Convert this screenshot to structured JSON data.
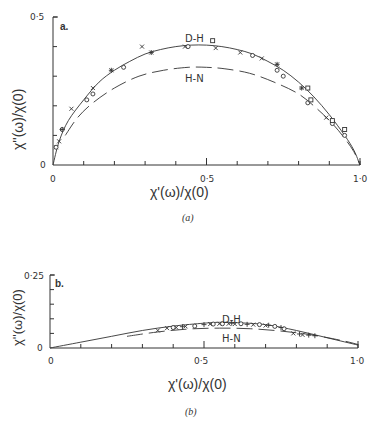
{
  "chart_data": [
    {
      "type": "scatter",
      "panel": "a",
      "panel_label": "a.",
      "caption": "(a)",
      "xlabel": "χ'(ω)/χ(0)",
      "ylabel": "χ''(ω)/χ(0)",
      "xlim": [
        0,
        1.0
      ],
      "ylim": [
        0,
        0.5
      ],
      "x_tick_labels": [
        "0",
        "0·5",
        "1·0"
      ],
      "y_tick_labels": [
        "0",
        "0·5"
      ],
      "x_minor_ticks": [
        0.1,
        0.2,
        0.3,
        0.4,
        0.5,
        0.6,
        0.7,
        0.8,
        0.9,
        1.0
      ],
      "y_minor_ticks": [
        0.1,
        0.2,
        0.3,
        0.4,
        0.5
      ],
      "grid": false,
      "curves": [
        {
          "name": "D-H",
          "label": "D-H",
          "style": "solid",
          "points": [
            [
              0,
              0
            ],
            [
              0.02,
              0.08
            ],
            [
              0.05,
              0.15
            ],
            [
              0.1,
              0.22
            ],
            [
              0.15,
              0.28
            ],
            [
              0.2,
              0.32
            ],
            [
              0.25,
              0.35
            ],
            [
              0.3,
              0.375
            ],
            [
              0.35,
              0.39
            ],
            [
              0.4,
              0.4
            ],
            [
              0.45,
              0.405
            ],
            [
              0.5,
              0.405
            ],
            [
              0.55,
              0.4
            ],
            [
              0.6,
              0.39
            ],
            [
              0.65,
              0.375
            ],
            [
              0.7,
              0.35
            ],
            [
              0.75,
              0.32
            ],
            [
              0.8,
              0.28
            ],
            [
              0.85,
              0.23
            ],
            [
              0.9,
              0.17
            ],
            [
              0.95,
              0.1
            ],
            [
              0.98,
              0.05
            ],
            [
              1.0,
              0
            ]
          ]
        },
        {
          "name": "H-N",
          "label": "H-N",
          "style": "dashed",
          "points": [
            [
              0.04,
              0.1
            ],
            [
              0.08,
              0.16
            ],
            [
              0.13,
              0.21
            ],
            [
              0.2,
              0.26
            ],
            [
              0.28,
              0.3
            ],
            [
              0.36,
              0.32
            ],
            [
              0.44,
              0.33
            ],
            [
              0.5,
              0.33
            ],
            [
              0.56,
              0.325
            ],
            [
              0.64,
              0.31
            ],
            [
              0.72,
              0.28
            ],
            [
              0.8,
              0.24
            ],
            [
              0.86,
              0.19
            ],
            [
              0.91,
              0.14
            ],
            [
              0.95,
              0.09
            ],
            [
              0.98,
              0.045
            ],
            [
              1.0,
              0
            ]
          ]
        }
      ],
      "series": [
        {
          "name": "crosses",
          "marker": "x",
          "points": [
            [
              0.06,
              0.19
            ],
            [
              0.13,
              0.26
            ],
            [
              0.19,
              0.32
            ],
            [
              0.29,
              0.4
            ],
            [
              0.32,
              0.38
            ],
            [
              0.43,
              0.4
            ],
            [
              0.53,
              0.395
            ],
            [
              0.61,
              0.38
            ],
            [
              0.68,
              0.36
            ],
            [
              0.73,
              0.34
            ],
            [
              0.81,
              0.26
            ],
            [
              0.89,
              0.16
            ],
            [
              0.02,
              0.08
            ],
            [
              0.01,
              0.06
            ]
          ]
        },
        {
          "name": "circles",
          "marker": "o",
          "points": [
            [
              0.01,
              0.06
            ],
            [
              0.03,
              0.12
            ],
            [
              0.11,
              0.22
            ],
            [
              0.13,
              0.24
            ],
            [
              0.23,
              0.33
            ],
            [
              0.44,
              0.4
            ],
            [
              0.65,
              0.37
            ],
            [
              0.73,
              0.32
            ],
            [
              0.75,
              0.3
            ],
            [
              0.83,
              0.21
            ],
            [
              0.91,
              0.14
            ],
            [
              0.95,
              0.1
            ]
          ]
        },
        {
          "name": "squares",
          "marker": "s",
          "points": [
            [
              0.52,
              0.42
            ],
            [
              0.83,
              0.26
            ],
            [
              0.84,
              0.22
            ],
            [
              0.91,
              0.15
            ],
            [
              0.95,
              0.12
            ]
          ]
        },
        {
          "name": "pluses",
          "marker": "+",
          "points": [
            [
              0.03,
              0.12
            ],
            [
              0.19,
              0.32
            ],
            [
              0.32,
              0.38
            ],
            [
              0.73,
              0.34
            ],
            [
              0.81,
              0.26
            ]
          ]
        }
      ]
    },
    {
      "type": "scatter",
      "panel": "b",
      "panel_label": "b.",
      "caption": "(b)",
      "xlabel": "χ'(ω)/χ(0)",
      "ylabel": "χ''(ω)/χ(0)",
      "xlim": [
        0,
        1.0
      ],
      "ylim": [
        0,
        0.25
      ],
      "x_tick_labels": [
        "0",
        "0·5",
        "1·0"
      ],
      "y_tick_labels": [
        "0",
        "0·25"
      ],
      "x_minor_ticks": [
        0.1,
        0.2,
        0.3,
        0.4,
        0.5,
        0.6,
        0.7,
        0.8,
        0.9,
        1.0
      ],
      "y_minor_ticks": [
        0.05,
        0.1,
        0.15,
        0.2,
        0.25
      ],
      "grid": false,
      "curves": [
        {
          "name": "D-H",
          "label": "D-H",
          "style": "solid",
          "points": [
            [
              0,
              0
            ],
            [
              0.1,
              0.02
            ],
            [
              0.2,
              0.04
            ],
            [
              0.3,
              0.06
            ],
            [
              0.4,
              0.075
            ],
            [
              0.5,
              0.085
            ],
            [
              0.55,
              0.088
            ],
            [
              0.6,
              0.087
            ],
            [
              0.7,
              0.08
            ],
            [
              0.8,
              0.06
            ],
            [
              0.9,
              0.035
            ],
            [
              1.0,
              0.01
            ]
          ]
        },
        {
          "name": "H-N",
          "label": "H-N",
          "style": "dashed",
          "points": [
            [
              0.25,
              0.04
            ],
            [
              0.35,
              0.055
            ],
            [
              0.45,
              0.065
            ],
            [
              0.55,
              0.068
            ],
            [
              0.65,
              0.066
            ],
            [
              0.75,
              0.058
            ],
            [
              0.85,
              0.045
            ],
            [
              0.95,
              0.025
            ],
            [
              1.0,
              0.012
            ]
          ]
        }
      ],
      "series": [
        {
          "name": "crosses",
          "marker": "x",
          "points": [
            [
              0.35,
              0.06
            ],
            [
              0.38,
              0.068
            ],
            [
              0.41,
              0.07
            ],
            [
              0.44,
              0.074
            ],
            [
              0.52,
              0.082
            ],
            [
              0.55,
              0.083
            ],
            [
              0.58,
              0.083
            ],
            [
              0.6,
              0.082
            ],
            [
              0.66,
              0.08
            ],
            [
              0.7,
              0.077
            ],
            [
              0.79,
              0.05
            ],
            [
              0.82,
              0.045
            ]
          ]
        },
        {
          "name": "circles",
          "marker": "o",
          "points": [
            [
              0.4,
              0.07
            ],
            [
              0.47,
              0.075
            ],
            [
              0.53,
              0.082
            ],
            [
              0.56,
              0.083
            ],
            [
              0.62,
              0.083
            ],
            [
              0.68,
              0.08
            ],
            [
              0.73,
              0.074
            ],
            [
              0.76,
              0.066
            ]
          ]
        },
        {
          "name": "pluses",
          "marker": "+",
          "points": [
            [
              0.43,
              0.073
            ],
            [
              0.5,
              0.08
            ],
            [
              0.59,
              0.085
            ],
            [
              0.64,
              0.081
            ],
            [
              0.71,
              0.078
            ],
            [
              0.75,
              0.07
            ],
            [
              0.81,
              0.048
            ],
            [
              0.84,
              0.044
            ],
            [
              0.86,
              0.042
            ]
          ]
        }
      ]
    }
  ],
  "panels": {
    "a": {
      "tag": "a.",
      "dh": "D-H",
      "hn": "H-N",
      "xlabel": "χ'(ω)/χ(0)",
      "ylabel": "χ''(ω)/χ(0)",
      "caption": "(a)",
      "y_top": "0·5",
      "y_zero": "0",
      "x_zero": "0",
      "x_mid": "0·5",
      "x_end": "1·0"
    },
    "b": {
      "tag": "b.",
      "dh": "D-H",
      "hn": "H-N",
      "xlabel": "χ'(ω)/χ(0)",
      "ylabel": "χ''(ω)/χ(0)",
      "caption": "(b)",
      "y_top": "0·25",
      "y_zero": "0",
      "x_zero": "0",
      "x_mid": "0·5",
      "x_end": "1·0"
    }
  }
}
